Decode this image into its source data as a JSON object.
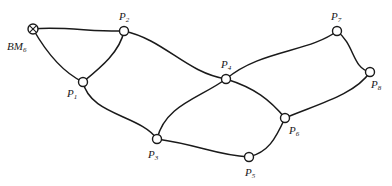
{
  "diagram": {
    "benchmark": {
      "id": "BM6",
      "label_main": "BM",
      "label_sub": "6",
      "symbol": "circle-cross-icon",
      "x": 33,
      "y": 29
    },
    "nodes": [
      {
        "id": "P1",
        "label_main": "P",
        "label_sub": "1",
        "x": 83,
        "y": 82,
        "label_x": 67,
        "label_y": 97
      },
      {
        "id": "P2",
        "label_main": "P",
        "label_sub": "2",
        "x": 124,
        "y": 31,
        "label_x": 119,
        "label_y": 20
      },
      {
        "id": "P3",
        "label_main": "P",
        "label_sub": "3",
        "x": 157,
        "y": 139,
        "label_x": 148,
        "label_y": 158
      },
      {
        "id": "P4",
        "label_main": "P",
        "label_sub": "4",
        "x": 226,
        "y": 79,
        "label_x": 221,
        "label_y": 68
      },
      {
        "id": "P5",
        "label_main": "P",
        "label_sub": "5",
        "x": 249,
        "y": 157,
        "label_x": 245,
        "label_y": 176
      },
      {
        "id": "P6",
        "label_main": "P",
        "label_sub": "6",
        "x": 285,
        "y": 118,
        "label_x": 289,
        "label_y": 134
      },
      {
        "id": "P7",
        "label_main": "P",
        "label_sub": "7",
        "x": 337,
        "y": 31,
        "label_x": 331,
        "label_y": 20
      },
      {
        "id": "P8",
        "label_main": "P",
        "label_sub": "8",
        "x": 370,
        "y": 72,
        "label_x": 371,
        "label_y": 88
      }
    ],
    "edges": [
      {
        "from": "BM6",
        "to": "P2",
        "path": "M33,29 C60,26 95,32 124,31"
      },
      {
        "from": "BM6",
        "to": "P1",
        "path": "M33,29 C45,50 62,72 83,82"
      },
      {
        "from": "P1",
        "to": "P2",
        "path": "M83,82 C100,68 120,52 124,31"
      },
      {
        "from": "P2",
        "to": "P4",
        "path": "M124,31 C165,40 185,72 226,79"
      },
      {
        "from": "P1",
        "to": "P3",
        "path": "M83,82 C90,115 140,115 157,139"
      },
      {
        "from": "P3",
        "to": "P4",
        "path": "M157,139 C165,105 200,98 226,79"
      },
      {
        "from": "P3",
        "to": "P5",
        "path": "M157,139 C200,145 215,155 249,157"
      },
      {
        "from": "P4",
        "to": "P7",
        "path": "M226,79 C260,50 310,52 337,31"
      },
      {
        "from": "P4",
        "to": "P6",
        "path": "M226,79 C255,88 270,100 285,118"
      },
      {
        "from": "P7",
        "to": "P8",
        "path": "M337,31 C355,45 352,68 370,72"
      },
      {
        "from": "P8",
        "to": "P6",
        "path": "M370,72 C355,95 315,105 285,118"
      },
      {
        "from": "P6",
        "to": "P5",
        "path": "M285,118 C275,140 268,152 249,157"
      }
    ]
  }
}
